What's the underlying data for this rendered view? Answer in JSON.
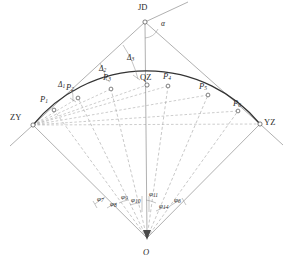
{
  "figure": {
    "type": "engineering-diagram",
    "background_color": "#ffffff",
    "line_color": "#6b6b6b",
    "curve_color": "#3a3a3a",
    "dash_color": "#8a8a8a",
    "text_color": "#2b2b2b"
  },
  "control_points": [
    {
      "id": "JD",
      "label": "JD",
      "x": 145,
      "y": 22,
      "marker": "circle"
    },
    {
      "id": "ZY",
      "label": "ZY",
      "x": 33,
      "y": 125,
      "marker": "circle"
    },
    {
      "id": "YZ",
      "label": "YZ",
      "x": 260,
      "y": 124,
      "marker": "circle"
    },
    {
      "id": "QZ",
      "label": "QZ",
      "x": 147,
      "y": 85,
      "marker": "circle"
    },
    {
      "id": "O",
      "label": "O",
      "x": 147,
      "y": 238,
      "marker": "arrowhead"
    }
  ],
  "curve_points": [
    {
      "label": "P",
      "sub": "1",
      "x": 54,
      "y": 110,
      "label_x": 42,
      "label_y": 98
    },
    {
      "label": "P",
      "sub": "2",
      "x": 78,
      "y": 98,
      "label_x": 68,
      "label_y": 86
    },
    {
      "label": "P",
      "sub": "3",
      "x": 111,
      "y": 89,
      "label_x": 105,
      "label_y": 76
    },
    {
      "label": "P",
      "sub": "4",
      "x": 168,
      "y": 86,
      "label_x": 164,
      "label_y": 74
    },
    {
      "label": "P",
      "sub": "5",
      "x": 208,
      "y": 95,
      "label_x": 199,
      "label_y": 84
    },
    {
      "label": "P",
      "sub": "6",
      "x": 238,
      "y": 111,
      "label_x": 234,
      "label_y": 100
    }
  ],
  "deflection_angles": [
    {
      "label": "Δ",
      "sub": "1",
      "x": 60,
      "y": 84
    },
    {
      "label": "Δ",
      "sub": "2",
      "x": 101,
      "y": 68
    },
    {
      "label": "Δ",
      "sub": "3",
      "x": 128,
      "y": 57
    }
  ],
  "central_angles": [
    {
      "label": "φ",
      "sub": "7",
      "x": 100,
      "y": 199
    },
    {
      "label": "φ",
      "sub": "8",
      "x": 112,
      "y": 203
    },
    {
      "label": "φ",
      "sub": "9",
      "x": 123,
      "y": 197
    },
    {
      "label": "φ",
      "sub": "10",
      "x": 133,
      "y": 199
    },
    {
      "label": "φ",
      "sub": "11",
      "x": 150,
      "y": 194
    },
    {
      "label": "φ",
      "sub": "14",
      "x": 161,
      "y": 205
    },
    {
      "label": "φ",
      "sub": "6",
      "x": 175,
      "y": 200
    }
  ],
  "intersection_angle": {
    "label": "α",
    "x": 160,
    "y": 25
  },
  "geometry": {
    "center": {
      "x": 147,
      "y": 238
    },
    "radius": 147,
    "tangent_left_outer": {
      "x": 8,
      "y": 150
    },
    "tangent_right_outer": {
      "x": 285,
      "y": 150
    },
    "alpha_ray_end": {
      "x": 188,
      "y": 3
    },
    "axis_top": {
      "x": 145,
      "y": 22
    },
    "axis_bottom": {
      "x": 147,
      "y": 238
    }
  }
}
